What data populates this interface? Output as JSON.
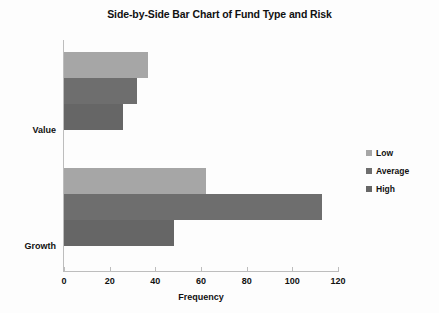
{
  "chart_data": {
    "type": "bar",
    "orientation": "horizontal",
    "title": "Side-by-Side Bar Chart of Fund Type and Risk",
    "xlabel": "Frequency",
    "ylabel": "",
    "categories": [
      "Value",
      "Growth"
    ],
    "series": [
      {
        "name": "Low",
        "values": [
          37,
          62
        ],
        "color": "#a6a6a6"
      },
      {
        "name": "Average",
        "values": [
          32,
          113
        ],
        "color": "#6e6e6e"
      },
      {
        "name": "High",
        "values": [
          26,
          48
        ],
        "color": "#666666"
      }
    ],
    "xlim": [
      0,
      120
    ],
    "xticks": [
      0,
      20,
      40,
      60,
      80,
      100,
      120
    ],
    "xtick_labels": [
      "0",
      "20",
      "40",
      "60",
      "80",
      "100",
      "120"
    ],
    "grid": false,
    "legend_position": "right",
    "legend_entries": [
      "Low",
      "Average",
      "High"
    ]
  },
  "axis": {
    "line_color": "#bdbdbd",
    "background": "#fdfdfd"
  }
}
